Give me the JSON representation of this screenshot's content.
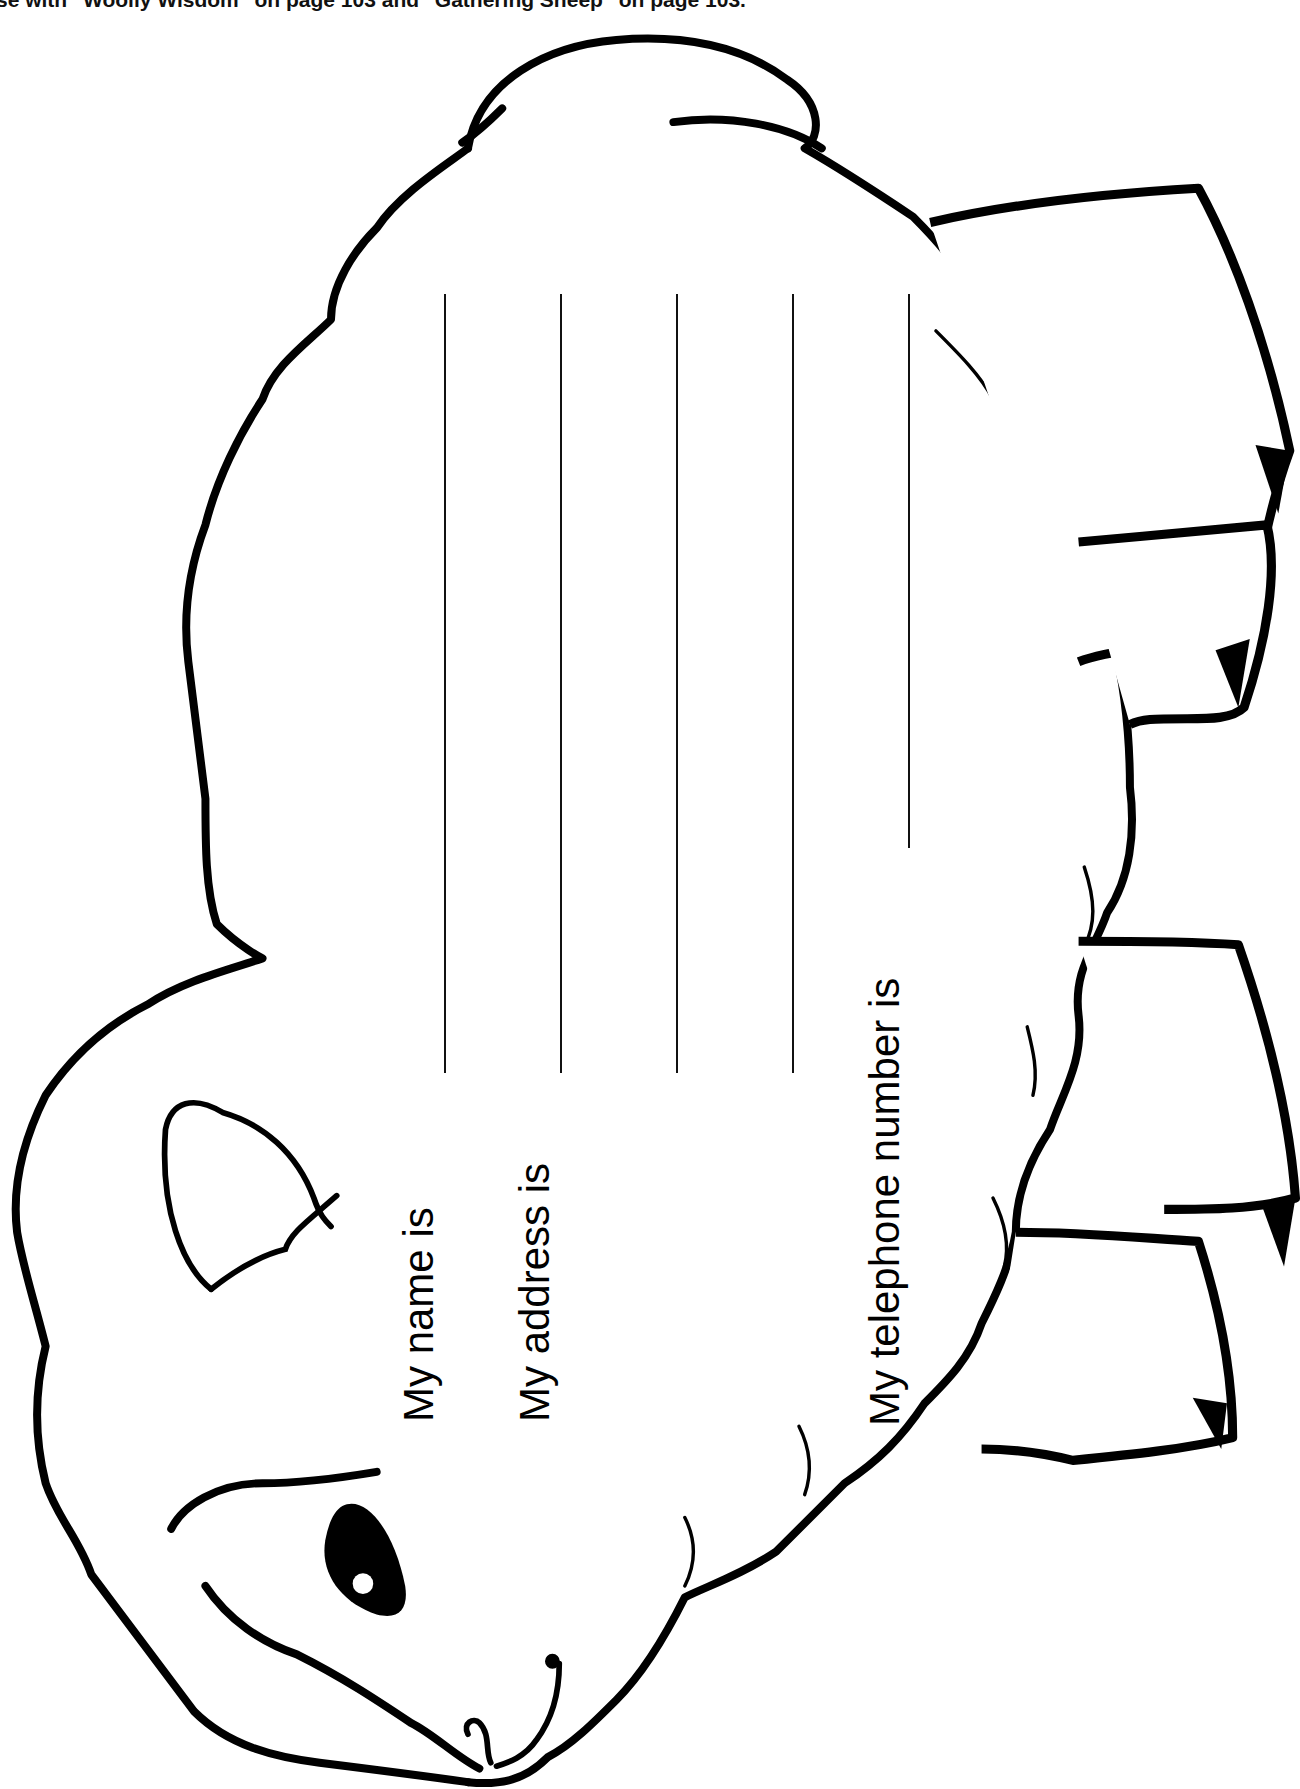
{
  "header": {
    "text": "se with \"Woolly Wisdom\" on page 103 and \"Gathering Sheep\" on page 103."
  },
  "worksheet": {
    "title": "Sheep information card",
    "fields": [
      {
        "label": "My name is",
        "lines": 1
      },
      {
        "label": "My address is",
        "lines": 3
      },
      {
        "label": "My telephone number is",
        "lines": 1
      }
    ]
  },
  "colors": {
    "ink": "#000000",
    "paper": "#ffffff"
  },
  "icons": [
    "sheep-outline-icon",
    "sheep-eye-icon",
    "sheep-ear-icon",
    "sheep-mouth-icon",
    "sheep-leg-icon"
  ]
}
